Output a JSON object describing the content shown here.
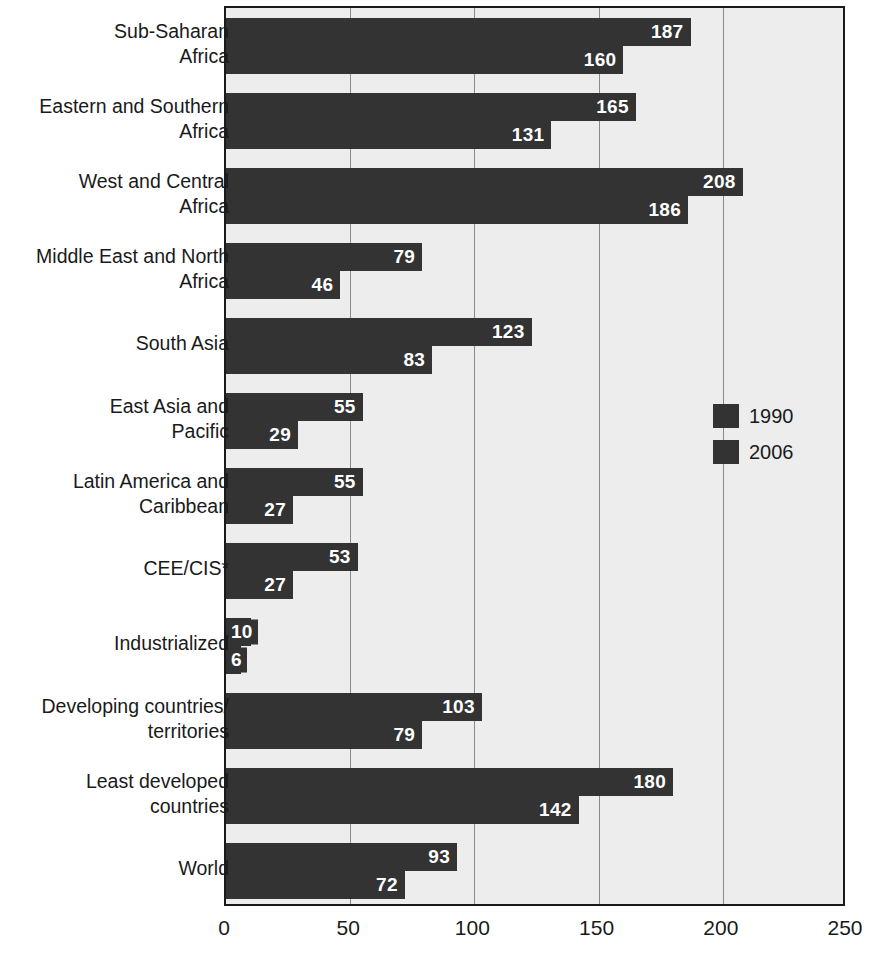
{
  "chart_data": {
    "type": "bar",
    "orientation": "horizontal",
    "title": "",
    "subtitle": "",
    "xlabel": "",
    "ylabel": "",
    "xlim": [
      0,
      250
    ],
    "xticks": [
      "0",
      "50",
      "100",
      "150",
      "200",
      "250"
    ],
    "xtick_values": [
      0,
      50,
      100,
      150,
      200,
      250
    ],
    "grid": true,
    "grid_axis": "x",
    "legend_position": "right",
    "categories": [
      "Sub-Saharan\nAfrica",
      "Eastern and Southern\nAfrica",
      "West and Central\nAfrica",
      "Middle East and North\nAfrica",
      "South Asia",
      "East Asia and\nPacific",
      "Latin America and\nCaribbean",
      "CEE/CIS*",
      "Industrialized",
      "Developing countries/\nterritories",
      "Least developed\ncountries",
      "World"
    ],
    "series": [
      {
        "name": "1990",
        "color": "#333333",
        "values": [
          187,
          165,
          208,
          79,
          123,
          55,
          55,
          53,
          10,
          103,
          180,
          93
        ]
      },
      {
        "name": "2006",
        "color": "#333333",
        "values": [
          160,
          131,
          186,
          46,
          83,
          29,
          27,
          27,
          6,
          79,
          142,
          72
        ]
      }
    ]
  },
  "legend": {
    "entries": [
      {
        "label": "1990",
        "swatch": "legend-swatch-1990"
      },
      {
        "label": "2006",
        "swatch": "legend-swatch-2006"
      }
    ]
  },
  "colors": {
    "bar": "#333333",
    "plot_background": "#ededed",
    "gridline": "#8a8a8a",
    "axis": "#1a1a1a",
    "value_label": "#ffffff"
  }
}
